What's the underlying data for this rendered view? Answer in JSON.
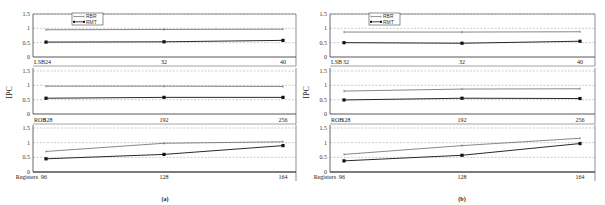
{
  "chart_data": [
    {
      "type": "line",
      "caption": "(a)",
      "ylabel": "IPC",
      "legend": [
        "RBR",
        "RMT"
      ],
      "legend_position": "upper-left inside top panel",
      "grid": "horizontal dashed",
      "panels": [
        {
          "xlabel": "LSB",
          "categories": [
            "24",
            "32",
            "40"
          ],
          "ylim": [
            0,
            1.5
          ],
          "yticks": [
            "0",
            "0.5",
            "1",
            "1.5"
          ],
          "series": [
            {
              "name": "RBR",
              "values": [
                0.95,
                0.96,
                0.97
              ]
            },
            {
              "name": "RMT",
              "values": [
                0.52,
                0.53,
                0.58
              ]
            }
          ]
        },
        {
          "xlabel": "ROB",
          "categories": [
            "128",
            "192",
            "256"
          ],
          "ylim": [
            0,
            1.5
          ],
          "yticks": [
            "0",
            "0.5",
            "1",
            "1.5"
          ],
          "series": [
            {
              "name": "RBR",
              "values": [
                0.97,
                0.97,
                0.96
              ]
            },
            {
              "name": "RMT",
              "values": [
                0.55,
                0.58,
                0.58
              ]
            }
          ]
        },
        {
          "xlabel": "Registers",
          "categories": [
            "96",
            "128",
            "164"
          ],
          "ylim": [
            0,
            1.5
          ],
          "yticks": [
            "0",
            "0.5",
            "1",
            "1.5"
          ],
          "series": [
            {
              "name": "RBR",
              "values": [
                0.7,
                0.98,
                1.03
              ]
            },
            {
              "name": "RMT",
              "values": [
                0.45,
                0.6,
                0.9
              ]
            }
          ]
        }
      ]
    },
    {
      "type": "line",
      "caption": "(b)",
      "ylabel": "IPC",
      "legend": [
        "RBR",
        "RMT"
      ],
      "legend_position": "upper-left inside top panel",
      "grid": "horizontal dashed",
      "panels": [
        {
          "xlabel": "LSB",
          "categories": [
            "32",
            "32",
            "40"
          ],
          "ylim": [
            0,
            1.5
          ],
          "yticks": [
            "0",
            "0.5",
            "1",
            "1.5"
          ],
          "series": [
            {
              "name": "RBR",
              "values": [
                0.87,
                0.87,
                0.88
              ]
            },
            {
              "name": "RMT",
              "values": [
                0.5,
                0.48,
                0.55
              ]
            }
          ]
        },
        {
          "xlabel": "ROB",
          "categories": [
            "128",
            "192",
            "256"
          ],
          "ylim": [
            0,
            1.5
          ],
          "yticks": [
            "0",
            "0.5",
            "1",
            "1.5"
          ],
          "series": [
            {
              "name": "RBR",
              "values": [
                0.8,
                0.87,
                0.88
              ]
            },
            {
              "name": "RMT",
              "values": [
                0.49,
                0.55,
                0.54
              ]
            }
          ]
        },
        {
          "xlabel": "Registers",
          "categories": [
            "96",
            "128",
            "164"
          ],
          "ylim": [
            0,
            1.5
          ],
          "yticks": [
            "0",
            "0.5",
            "1",
            "1.5"
          ],
          "series": [
            {
              "name": "RBR",
              "values": [
                0.6,
                0.9,
                1.15
              ]
            },
            {
              "name": "RMT",
              "values": [
                0.38,
                0.57,
                0.97
              ]
            }
          ]
        }
      ]
    }
  ],
  "colors": {
    "rbr_line": "#555555",
    "rmt_line": "#111111",
    "frame": "#444444",
    "grid": "#999999"
  }
}
